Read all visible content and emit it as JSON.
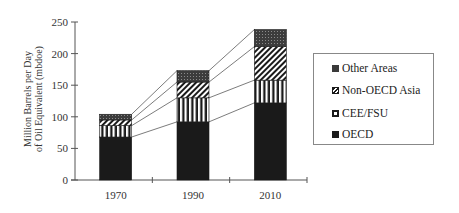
{
  "chart_data": {
    "type": "bar",
    "stacked": true,
    "title": "",
    "xlabel": "",
    "ylabel": "Million Barrels per Day of Oil Equivalent (mbdoe)",
    "ylabel_lines": [
      "Million Barrels per Day",
      "of Oil Equivalent (mbdoe)"
    ],
    "ylim": [
      0,
      250
    ],
    "yticks": [
      0,
      50,
      100,
      150,
      200,
      250
    ],
    "categories": [
      "1970",
      "1990",
      "2010"
    ],
    "series": [
      {
        "name": "OECD",
        "values": [
          68,
          92,
          122
        ],
        "pattern": "solid-dark",
        "color": "#1a1a1a"
      },
      {
        "name": "CEE/FSU",
        "values": [
          18,
          38,
          36
        ],
        "pattern": "vertical-stripes",
        "color": "#1a1a1a"
      },
      {
        "name": "Non-OECD Asia",
        "values": [
          9,
          25,
          53
        ],
        "pattern": "diagonal-hatch",
        "color": "#1a1a1a"
      },
      {
        "name": "Other Areas",
        "values": [
          9,
          18,
          27
        ],
        "pattern": "dark-stipple",
        "color": "#3a3a3a"
      }
    ],
    "totals": [
      104,
      173,
      238
    ],
    "connector_lines": true,
    "grid": false,
    "legend_position": "right",
    "legend_order": [
      "Other Areas",
      "Non-OECD Asia",
      "CEE/FSU",
      "OECD"
    ]
  },
  "legend": {
    "items": [
      {
        "label": "Other Areas"
      },
      {
        "label": "Non-OECD Asia"
      },
      {
        "label": "CEE/FSU"
      },
      {
        "label": "OECD"
      }
    ]
  }
}
